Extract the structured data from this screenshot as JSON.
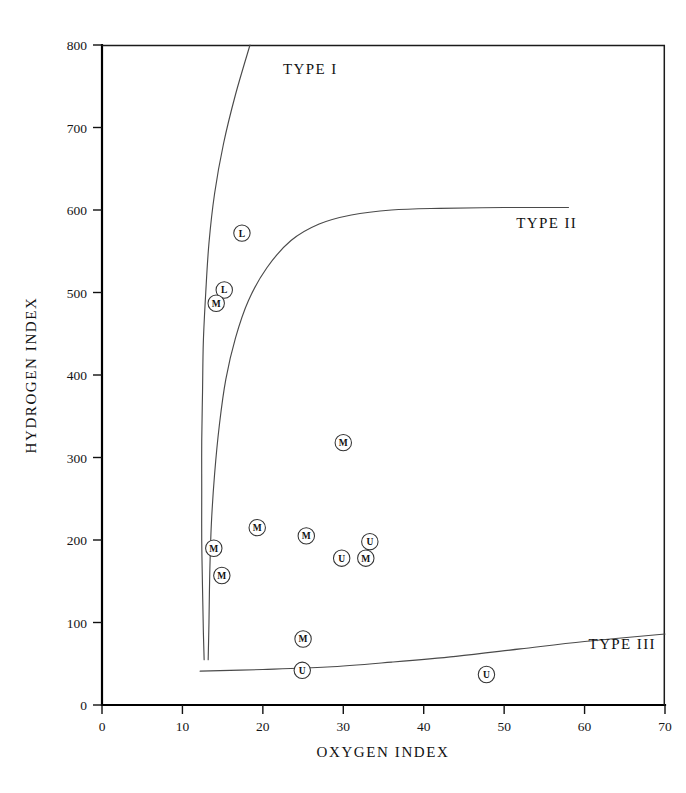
{
  "chart_data": {
    "type": "scatter",
    "title": "",
    "xlabel": "OXYGEN INDEX",
    "ylabel": "HYDROGEN INDEX",
    "xlim": [
      0,
      70
    ],
    "ylim": [
      0,
      800
    ],
    "xticks": [
      0,
      10,
      20,
      30,
      40,
      50,
      60,
      70
    ],
    "yticks": [
      0,
      100,
      200,
      300,
      400,
      500,
      600,
      700,
      800
    ],
    "xtick_labels": [
      "0",
      "10",
      "20",
      "30",
      "40",
      "50",
      "60",
      "70"
    ],
    "ytick_labels": [
      "0",
      "100",
      "200",
      "300",
      "400",
      "500",
      "600",
      "700",
      "800"
    ],
    "grid": false,
    "legend": "none",
    "marker_style": "circled-letter",
    "points": [
      {
        "label": "L",
        "x": 17.4,
        "y": 572
      },
      {
        "label": "L",
        "x": 15.2,
        "y": 503
      },
      {
        "label": "M",
        "x": 14.2,
        "y": 487
      },
      {
        "label": "M",
        "x": 30.0,
        "y": 318
      },
      {
        "label": "M",
        "x": 19.3,
        "y": 215
      },
      {
        "label": "M",
        "x": 25.4,
        "y": 205
      },
      {
        "label": "U",
        "x": 33.3,
        "y": 198
      },
      {
        "label": "M",
        "x": 13.9,
        "y": 190
      },
      {
        "label": "U",
        "x": 29.8,
        "y": 178
      },
      {
        "label": "M",
        "x": 32.8,
        "y": 178
      },
      {
        "label": "M",
        "x": 14.9,
        "y": 157
      },
      {
        "label": "M",
        "x": 25.0,
        "y": 80
      },
      {
        "label": "U",
        "x": 24.9,
        "y": 42
      },
      {
        "label": "U",
        "x": 47.8,
        "y": 37
      }
    ],
    "annotations": [
      {
        "text": "TYPE I",
        "x": 22.5,
        "y": 765
      },
      {
        "text": "TYPE II",
        "x": 51.5,
        "y": 578
      },
      {
        "text": "TYPE III",
        "x": 60.5,
        "y": 68
      }
    ],
    "curves": [
      {
        "name": "TYPE I",
        "points": [
          [
            18.4,
            800
          ],
          [
            16.6,
            740
          ],
          [
            15.1,
            680
          ],
          [
            14.0,
            620
          ],
          [
            13.3,
            560
          ],
          [
            12.9,
            500
          ],
          [
            12.6,
            440
          ],
          [
            12.5,
            380
          ],
          [
            12.4,
            320
          ],
          [
            12.4,
            260
          ],
          [
            12.4,
            200
          ],
          [
            12.5,
            140
          ],
          [
            12.6,
            90
          ],
          [
            12.7,
            55
          ]
        ]
      },
      {
        "name": "TYPE II",
        "points": [
          [
            58.0,
            603
          ],
          [
            50.0,
            603
          ],
          [
            42.0,
            602
          ],
          [
            36.0,
            600
          ],
          [
            31.0,
            594
          ],
          [
            27.0,
            583
          ],
          [
            23.5,
            563
          ],
          [
            20.5,
            530
          ],
          [
            18.2,
            490
          ],
          [
            16.6,
            445
          ],
          [
            15.4,
            395
          ],
          [
            14.6,
            340
          ],
          [
            14.0,
            280
          ],
          [
            13.6,
            220
          ],
          [
            13.4,
            160
          ],
          [
            13.3,
            100
          ],
          [
            13.2,
            55
          ]
        ]
      },
      {
        "name": "TYPE III",
        "points": [
          [
            12.2,
            41
          ],
          [
            20.0,
            43
          ],
          [
            28.0,
            46
          ],
          [
            36.0,
            52
          ],
          [
            44.0,
            59
          ],
          [
            52.0,
            68
          ],
          [
            60.0,
            77
          ],
          [
            70.0,
            86
          ]
        ]
      }
    ]
  },
  "figure": {
    "background": "#ffffff",
    "axis_color": "#000000",
    "curve_color": "#4a4a4a",
    "marker_fill": "#ffffff"
  }
}
